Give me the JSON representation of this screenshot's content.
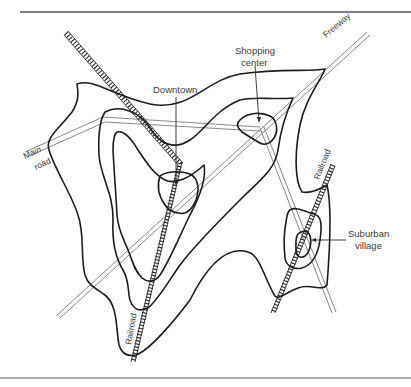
{
  "figure": {
    "type": "map-diagram"
  },
  "labels": {
    "shopping_center_line1": "Shopping",
    "shopping_center_line2": "center",
    "freeway": "Freeway",
    "downtown": "Downtown",
    "main_road_line1": "Main",
    "main_road_line2": "road",
    "railroad_upper": "Railroad",
    "railroad_lower": "Railroad",
    "suburban_village_line1": "Suburban",
    "suburban_village_line2": "village"
  },
  "features": {
    "peaks": [
      "Downtown",
      "Shopping center",
      "Suburban village"
    ],
    "routes": [
      "Main road",
      "Freeway",
      "Railroad",
      "Railroad"
    ]
  },
  "colors": {
    "background": "#ffffff",
    "contour": "#1c1c1c",
    "road": "#7a7a7a",
    "text": "#3a3a3a"
  }
}
